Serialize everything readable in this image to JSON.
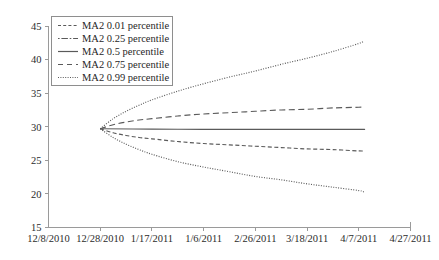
{
  "chart_data": {
    "type": "line",
    "title": "",
    "xlabel": "",
    "ylabel": "",
    "ylim": [
      15,
      45
    ],
    "ytick_step": 5,
    "yticks": [
      "15",
      "20",
      "25",
      "30",
      "35",
      "40",
      "45"
    ],
    "grid": false,
    "legend_position": "top-left-inside",
    "x_categories": [
      "12/8/2010",
      "12/28/2010",
      "1/17/2011",
      "1/6/2011",
      "2/26/2011",
      "3/18/2011",
      "4/7/2011",
      "4/27/2011"
    ],
    "x_tick_index_range": [
      0,
      7
    ],
    "series": [
      {
        "name": "MA2 0.01 percentile",
        "style": "dotted",
        "legend_style": "short-dash",
        "x_index": [
          1.0,
          1.25,
          1.5,
          1.75,
          2.0,
          2.5,
          3.0,
          3.5,
          4.0,
          4.5,
          5.0,
          5.5,
          6.0,
          6.1
        ],
        "values": [
          29.7,
          28.4,
          27.4,
          26.6,
          25.9,
          24.8,
          24.0,
          23.3,
          22.6,
          22.1,
          21.5,
          21.0,
          20.5,
          20.3
        ]
      },
      {
        "name": "MA2 0.25 percentile",
        "style": "dash",
        "legend_style": "dash-dot",
        "x_index": [
          1.0,
          1.25,
          1.5,
          1.75,
          2.0,
          2.5,
          3.0,
          3.5,
          4.0,
          4.5,
          5.0,
          5.5,
          6.0,
          6.1
        ],
        "values": [
          29.7,
          29.1,
          28.7,
          28.4,
          28.2,
          27.8,
          27.5,
          27.3,
          27.1,
          26.9,
          26.7,
          26.6,
          26.4,
          26.4
        ]
      },
      {
        "name": "MA2 0.5 percentile",
        "style": "solid",
        "legend_style": "solid",
        "x_index": [
          1.0,
          2.0,
          3.0,
          4.0,
          5.0,
          6.0,
          6.1
        ],
        "values": [
          29.7,
          29.65,
          29.62,
          29.6,
          29.6,
          29.6,
          29.6
        ]
      },
      {
        "name": "MA2 0.75 percentile",
        "style": "long-dash",
        "legend_style": "long-dash",
        "x_index": [
          1.0,
          1.25,
          1.5,
          1.75,
          2.0,
          2.5,
          3.0,
          3.5,
          4.0,
          4.5,
          5.0,
          5.5,
          6.0,
          6.1
        ],
        "values": [
          29.7,
          30.3,
          30.7,
          31.0,
          31.2,
          31.6,
          31.9,
          32.1,
          32.3,
          32.5,
          32.6,
          32.8,
          32.9,
          32.95
        ]
      },
      {
        "name": "MA2 0.99 percentile",
        "style": "dotted",
        "legend_style": "dotted",
        "x_index": [
          1.0,
          1.25,
          1.5,
          1.75,
          2.0,
          2.5,
          3.0,
          3.5,
          4.0,
          4.5,
          5.0,
          5.5,
          6.0,
          6.1
        ],
        "values": [
          29.7,
          31.2,
          32.3,
          33.2,
          34.0,
          35.3,
          36.4,
          37.4,
          38.3,
          39.3,
          40.2,
          41.2,
          42.4,
          42.8
        ]
      }
    ]
  },
  "legend": {
    "entries": [
      "MA2 0.01 percentile",
      "MA2 0.25 percentile",
      "MA2 0.5 percentile",
      "MA2 0.75 percentile",
      "MA2 0.99 percentile"
    ]
  },
  "colors": {
    "line": "#5a5a5a",
    "axis": "#9a9a9a",
    "text": "#2b2b2b",
    "background": "#ffffff"
  }
}
